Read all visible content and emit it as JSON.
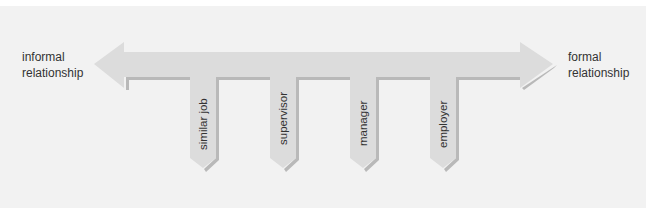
{
  "diagram": {
    "title": "",
    "left_end": {
      "line1": "informal",
      "line2": "relationship"
    },
    "right_end": {
      "line1": "formal",
      "line2": "relationship"
    },
    "drops": [
      {
        "label": "similar job"
      },
      {
        "label": "supervisor"
      },
      {
        "label": "manager"
      },
      {
        "label": "employer"
      }
    ],
    "colors": {
      "background": "#f2f2f2",
      "arrow_fill": "#dcdcdc",
      "arrow_shadow": "#b8b8b8",
      "text": "#333333"
    }
  }
}
